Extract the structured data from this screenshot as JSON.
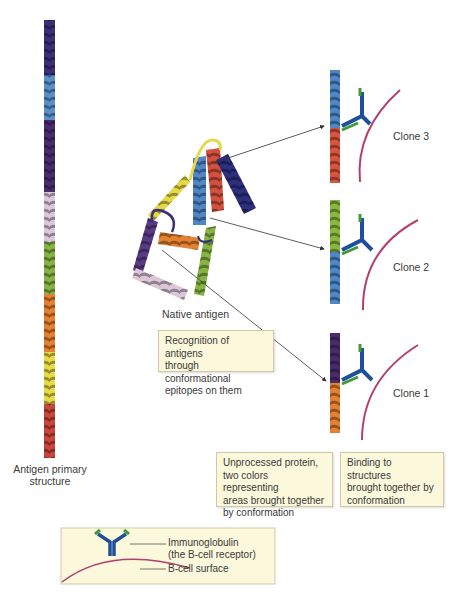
{
  "primary_structure": {
    "label_line1": "Antigen primary",
    "label_line2": "structure",
    "segments": [
      {
        "color": "#3b2f7a",
        "name": "indigo"
      },
      {
        "color": "#4f86c6",
        "name": "blue"
      },
      {
        "color": "#4a2c6e",
        "name": "purple"
      },
      {
        "color": "#d9bfd6",
        "name": "pink"
      },
      {
        "color": "#7fae3e",
        "name": "green"
      },
      {
        "color": "#e27d2e",
        "name": "orange"
      },
      {
        "color": "#e0d43c",
        "name": "yellow"
      },
      {
        "color": "#c8403a",
        "name": "red"
      }
    ]
  },
  "native_antigen": {
    "label": "Native antigen"
  },
  "notes": {
    "recognition": [
      "Recognition of antigens",
      "through conformational",
      "epitopes on them"
    ],
    "unprocessed": [
      "Unprocessed protein,",
      "two colors representing",
      "areas brought together",
      "by conformation"
    ],
    "binding": [
      "Binding to structures",
      "brought together by",
      "conformation"
    ]
  },
  "clones": [
    {
      "label": "Clone 3",
      "upper_color": "#4f86c6",
      "lower_color": "#d9543e"
    },
    {
      "label": "Clone 2",
      "upper_color": "#8ab83f",
      "lower_color": "#4f86c6"
    },
    {
      "label": "Clone 1",
      "upper_color": "#4a2c6e",
      "lower_color": "#e27d2e"
    }
  ],
  "legend": {
    "immunoglobulin_line1": "Immunoglobulin",
    "immunoglobulin_line2": "(the B-cell receptor)",
    "surface": "B-cell surface"
  },
  "colors": {
    "note_bg": "#fbf8dc",
    "membrane": "#b2406e",
    "receptor_heavy": "#1f4f9a",
    "receptor_light": "#3f9a3a"
  }
}
